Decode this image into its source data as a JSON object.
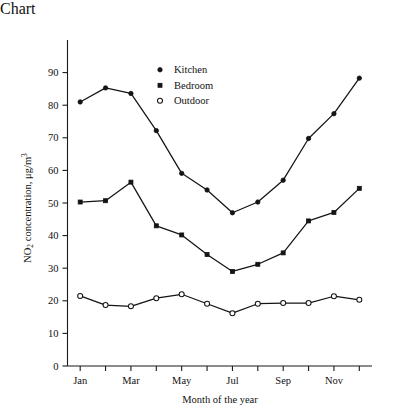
{
  "chart_data": {
    "type": "line",
    "title": "",
    "xlabel": "Month of the year",
    "ylabel": "NO2 concentration, μg/m3",
    "ylabel_parts": {
      "prefix": "NO",
      "sub": "2",
      "mid": " concentration, μg/m",
      "sup": "3"
    },
    "categories": [
      "Jan",
      "Feb",
      "Mar",
      "Apr",
      "May",
      "Jun",
      "Jul",
      "Aug",
      "Sep",
      "Oct",
      "Nov",
      "Dec"
    ],
    "x_tick_labels": [
      "Jan",
      "",
      "Mar",
      "",
      "May",
      "",
      "Jul",
      "",
      "Sep",
      "",
      "Nov",
      ""
    ],
    "x_visible_tick_labels": [
      "Jan",
      "Mar",
      "May",
      "Jul",
      "Sep",
      "Nov"
    ],
    "y_tick_labels": [
      "0",
      "10",
      "20",
      "30",
      "40",
      "50",
      "60",
      "70",
      "80",
      "90"
    ],
    "y_ticks": [
      0,
      10,
      20,
      30,
      40,
      50,
      60,
      70,
      80,
      90
    ],
    "ylim": [
      0,
      100
    ],
    "xlim": [
      0.5,
      12.5
    ],
    "grid": false,
    "legend_position": "upper-center",
    "series": [
      {
        "name": "Kitchen",
        "marker": "filled-circle",
        "color": "#141414",
        "values": [
          81.0,
          85.3,
          83.6,
          72.2,
          59.1,
          54.0,
          47.0,
          50.3,
          57.0,
          69.8,
          77.4,
          88.3
        ]
      },
      {
        "name": "Bedroom",
        "marker": "filled-square",
        "color": "#141414",
        "values": [
          50.3,
          50.7,
          56.4,
          43.0,
          40.2,
          34.2,
          29.0,
          31.2,
          34.7,
          44.5,
          47.1,
          54.5
        ]
      },
      {
        "name": "Outdoor",
        "marker": "open-circle",
        "color": "#141414",
        "values": [
          21.5,
          18.7,
          18.3,
          20.8,
          22.0,
          19.1,
          16.2,
          19.1,
          19.3,
          19.3,
          21.4,
          20.3
        ]
      }
    ]
  },
  "legend": {
    "entries": [
      {
        "label": "Kitchen",
        "marker": "filled-circle"
      },
      {
        "label": "Bedroom",
        "marker": "filled-square"
      },
      {
        "label": "Outdoor",
        "marker": "open-circle"
      }
    ]
  },
  "colors": {
    "ink": "#141414",
    "axis": "#1a1a1a",
    "background": "#ffffff"
  }
}
